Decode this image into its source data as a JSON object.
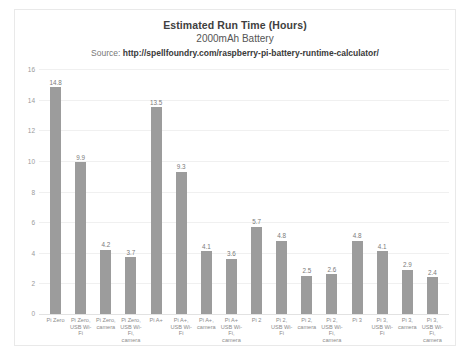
{
  "chart": {
    "title": "Estimated Run Time (Hours)",
    "subtitle": "2000mAh Battery",
    "source_label": "Source:",
    "source_url": "http://spellfoundry.com/raspberry-pi-battery-runtime-calculator/"
  },
  "colors": {
    "bar": "#9c9c9c",
    "gridline": "#f0f0f0",
    "title_text": "#404040",
    "axis_text": "#8c8c8c",
    "card_border": "#e9e9e9"
  },
  "chart_data": {
    "type": "bar",
    "title": "Estimated Run Time (Hours)",
    "subtitle": "2000mAh Battery",
    "xlabel": "",
    "ylabel": "",
    "ylim": [
      0,
      16
    ],
    "yticks": [
      0,
      2,
      4,
      6,
      8,
      10,
      12,
      14,
      16
    ],
    "grid": true,
    "legend": "none",
    "categories": [
      "Pi Zero",
      "Pi Zero, USB Wi-Fi",
      "Pi Zero, camera",
      "Pi Zero, USB Wi-Fi, camera",
      "Pi A+",
      "Pi A+, USB Wi-Fi",
      "Pi A+, camera",
      "Pi A+ USB Wi-Fi, camera",
      "Pi 2",
      "Pi 2, USB Wi-Fi",
      "Pi 2, camera",
      "Pi 2, USB Wi-Fi, camera",
      "Pi 3",
      "Pi 3, USB Wi-Fi",
      "Pi 3, camera",
      "Pi 3, USB Wi-Fi, camera"
    ],
    "values": [
      14.8,
      9.9,
      4.2,
      3.7,
      13.5,
      9.3,
      4.1,
      3.6,
      5.7,
      4.8,
      2.5,
      2.6,
      4.8,
      4.1,
      2.9,
      2.4
    ],
    "value_labels": [
      "14.8",
      "9.9",
      "4.2",
      "3.7",
      "13.5",
      "9.3",
      "4.1",
      "3.6",
      "5.7",
      "4.8",
      "2.5",
      "2.6",
      "4.8",
      "4.1",
      "2.9",
      "2.4"
    ]
  }
}
